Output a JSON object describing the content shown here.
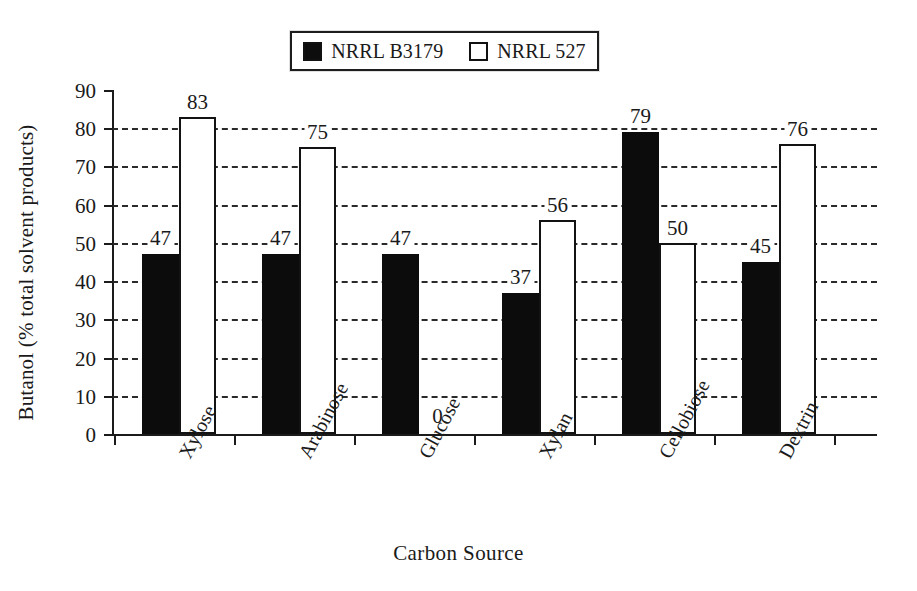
{
  "chart_data": {
    "type": "bar",
    "title": "",
    "xlabel": "Carbon Source",
    "ylabel": "Butanol (% total solvent products)",
    "categories": [
      "Xylose",
      "Arabinose",
      "Glucose",
      "Xylan",
      "Cellobiose",
      "Dextrin"
    ],
    "series": [
      {
        "name": "NRRL B3179",
        "style": "filled",
        "color": "#0c0c0c",
        "values": [
          47,
          47,
          47,
          37,
          79,
          45
        ]
      },
      {
        "name": "NRRL 527",
        "style": "hollow",
        "color": "#ffffff",
        "values": [
          83,
          75,
          0,
          56,
          50,
          76
        ]
      }
    ],
    "ylim": [
      0,
      90
    ],
    "ytick_values": [
      0,
      10,
      20,
      30,
      40,
      50,
      60,
      70,
      80,
      90
    ],
    "ytick_labels": [
      "0",
      "10",
      "20",
      "30",
      "40",
      "50",
      "60",
      "70",
      "80",
      "90"
    ],
    "gridline_values": [
      10,
      20,
      30,
      40,
      50,
      60,
      70,
      80
    ],
    "grid": "horizontal-dashed",
    "legend_position": "top-center",
    "data_labels": [
      [
        "47",
        "83"
      ],
      [
        "47",
        "75"
      ],
      [
        "47",
        "0"
      ],
      [
        "37",
        "56"
      ],
      [
        "79",
        "50"
      ],
      [
        "45",
        "76"
      ]
    ]
  },
  "legend": {
    "entries": [
      {
        "label": "NRRL B3179",
        "swatch": "filled-square-icon"
      },
      {
        "label": "NRRL 527",
        "swatch": "hollow-square-icon"
      }
    ]
  },
  "axes": {
    "x_title": "Carbon Source",
    "y_title": "Butanol (% total solvent products)"
  }
}
